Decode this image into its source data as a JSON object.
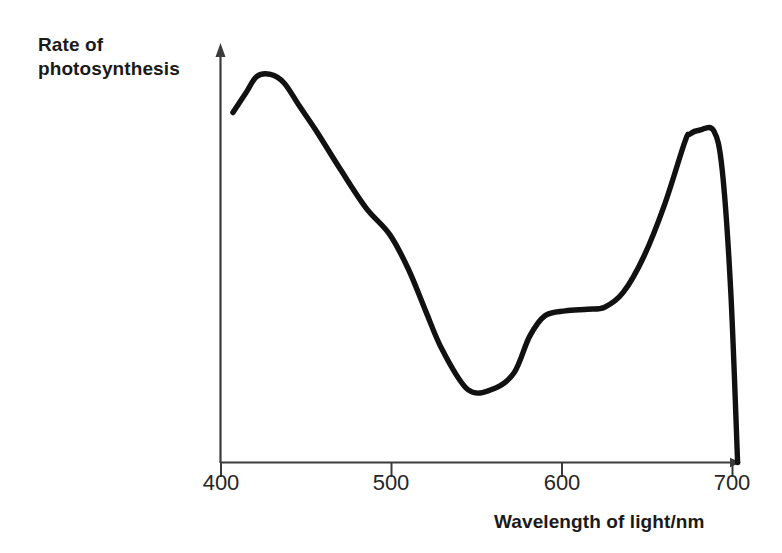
{
  "chart_data": {
    "type": "line",
    "title": "",
    "xlabel": "Wavelength of light/nm",
    "ylabel": "Rate of photosynthesis",
    "xlim": [
      400,
      700
    ],
    "ylim": [
      0,
      1
    ],
    "grid": false,
    "legend": null,
    "xticks": [
      400,
      500,
      600,
      700
    ],
    "xtick_labels": [
      "400",
      "500",
      "600",
      "700"
    ],
    "yticks": [],
    "ytick_labels": [],
    "series": [
      {
        "name": "Action spectrum of photosynthesis",
        "x": [
          407,
          415,
          421,
          429,
          437,
          446,
          456,
          470,
          485,
          499,
          510,
          520,
          530,
          545,
          560,
          572,
          581,
          590,
          602,
          615,
          625,
          636,
          648,
          660,
          672,
          675,
          681,
          689,
          694,
          699,
          703
        ],
        "y": [
          0.863,
          0.914,
          0.952,
          0.957,
          0.936,
          0.879,
          0.817,
          0.723,
          0.628,
          0.562,
          0.476,
          0.374,
          0.276,
          0.179,
          0.182,
          0.222,
          0.311,
          0.362,
          0.374,
          0.378,
          0.383,
          0.42,
          0.508,
          0.634,
          0.79,
          0.81,
          0.82,
          0.818,
          0.72,
          0.42,
          0.0
        ]
      }
    ],
    "annotations": [
      {
        "label": "blue peak",
        "x": 429,
        "y": 0.957
      },
      {
        "label": "green trough",
        "x": 545,
        "y": 0.179
      },
      {
        "label": "red peak",
        "x": 675,
        "y": 0.818
      }
    ]
  },
  "axes": {
    "y_axis_label": "Rate of\nphotosynthesis",
    "x_axis_label": "Wavelength of light/nm",
    "x_tick_labels": [
      "400",
      "500",
      "600",
      "700"
    ]
  },
  "style": {
    "curve_color": "#111111",
    "axis_color": "#3b3b3b",
    "text_color": "#1a1a1a",
    "background": "#ffffff"
  }
}
